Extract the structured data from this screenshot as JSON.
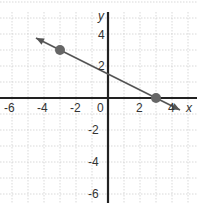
{
  "chart_data": {
    "type": "line",
    "title": "",
    "xlabel": "x",
    "ylabel": "y",
    "xlim": [
      -6.5,
      5.5
    ],
    "ylim": [
      -6.5,
      6
    ],
    "grid": true,
    "x_ticks": [
      "-6",
      "-4",
      "-2",
      "0",
      "2",
      "4"
    ],
    "y_ticks": [
      "4",
      "2",
      "-2",
      "-4",
      "-6"
    ],
    "series": [
      {
        "name": "line",
        "equation": "y = -0.5x + 1.5",
        "x": [
          -4.5,
          4.5
        ],
        "y": [
          3.75,
          -0.75
        ],
        "arrows": "both",
        "color": "#555555"
      }
    ],
    "points": [
      {
        "x": -3,
        "y": 3
      },
      {
        "x": 3,
        "y": 0
      }
    ],
    "point_color": "#666666"
  },
  "labels": {
    "x_axis": "x",
    "y_axis": "y",
    "origin": "0",
    "x_ticks": [
      {
        "label": "-6",
        "value": -6
      },
      {
        "label": "-4",
        "value": -4
      },
      {
        "label": "-2",
        "value": -2
      },
      {
        "label": "2",
        "value": 2
      },
      {
        "label": "4",
        "value": 4
      }
    ],
    "y_ticks": [
      {
        "label": "4",
        "value": 4
      },
      {
        "label": "2",
        "value": 2
      },
      {
        "label": "-2",
        "value": -2
      },
      {
        "label": "-4",
        "value": -4
      },
      {
        "label": "-6",
        "value": -6
      }
    ]
  }
}
